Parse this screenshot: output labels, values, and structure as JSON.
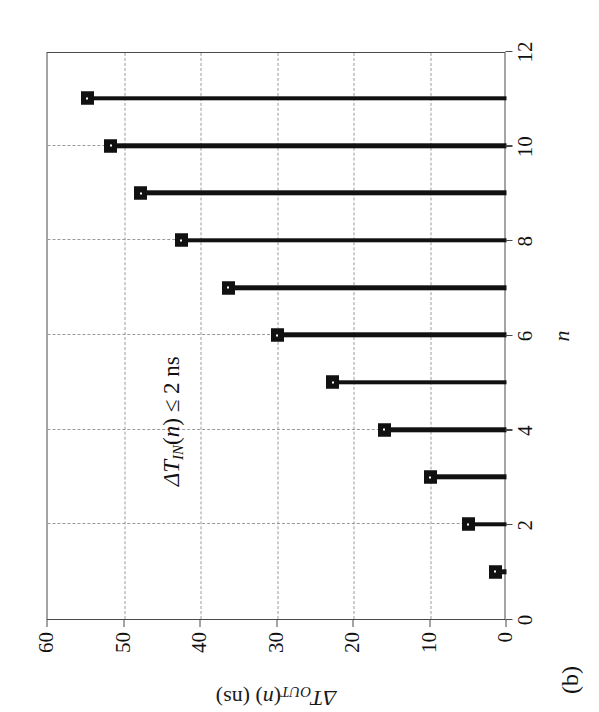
{
  "figure": {
    "subfigure_label": "(b)",
    "annotation": {
      "full_text": "ΔT_IN(n) ≤ 2 ns",
      "prefix": "ΔT",
      "subscript": "IN",
      "middle": "(",
      "variable": "n",
      "suffix": ") ≤ 2 ns"
    },
    "y_axis_title": {
      "prefix": "ΔT",
      "subscript": "OUT",
      "open": "(",
      "variable": "n",
      "suffix": ") (ns)"
    },
    "x_axis_title": "n"
  },
  "chart_data": {
    "type": "bar",
    "orientation": "vertical-stem",
    "title": "",
    "subtitle": "(b)",
    "xlabel": "n",
    "ylabel": "ΔT_OUT(n) (ns)",
    "xlim": [
      0,
      12
    ],
    "ylim": [
      0,
      60
    ],
    "xticks": [
      0,
      2,
      4,
      6,
      8,
      10,
      12
    ],
    "xtick_labels": [
      "0",
      "2",
      "4",
      "6",
      "8",
      "10",
      "12"
    ],
    "yticks": [
      0,
      10,
      20,
      30,
      40,
      50,
      60
    ],
    "ytick_labels": [
      "0",
      "10",
      "20",
      "30",
      "40",
      "50",
      "60"
    ],
    "grid": true,
    "grid_style": "dashed",
    "legend": null,
    "annotations": [
      {
        "text": "ΔT_IN(n) ≤ 2 ns",
        "x": 4.2,
        "y": 43.5
      }
    ],
    "categories": [
      1,
      2,
      3,
      4,
      5,
      6,
      7,
      8,
      9,
      10,
      11
    ],
    "values": [
      1.5,
      5.0,
      10.0,
      16.0,
      22.7,
      30.0,
      36.4,
      42.5,
      47.8,
      51.7,
      54.8
    ],
    "marker": "square",
    "series_color": "#111111",
    "grid_color": "#9a9a9a",
    "frame_color": "#4a4a4a"
  }
}
